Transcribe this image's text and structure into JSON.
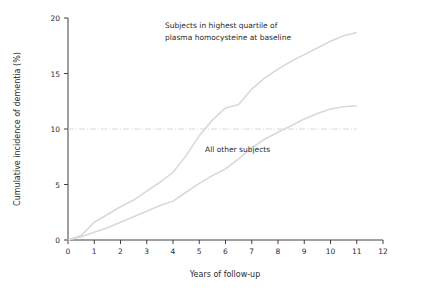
{
  "chart_data": {
    "type": "line",
    "title": "",
    "xlabel": "Years of follow-up",
    "ylabel": "Cumulative incidence of dementia (%)",
    "xlim": [
      0,
      12
    ],
    "ylim": [
      0,
      20
    ],
    "xticks": [
      "0",
      "1",
      "2",
      "3",
      "4",
      "5",
      "6",
      "7",
      "8",
      "9",
      "10",
      "11",
      "12"
    ],
    "yticks": [
      "0",
      "5",
      "10",
      "15",
      "20"
    ],
    "grid": false,
    "legend_position": "inline-annotations",
    "reference_line": {
      "y": 10,
      "style": "dash-dot",
      "color": "#d8d8d8"
    },
    "series": [
      {
        "name": "Subjects in highest quartile of plasma homocysteine at baseline",
        "color": "#d9d9d9",
        "x": [
          0,
          0.5,
          1,
          1.5,
          2,
          2.5,
          3,
          3.5,
          4,
          4.5,
          5,
          5.5,
          6,
          6.5,
          7,
          7.5,
          8,
          8.5,
          9,
          9.5,
          10,
          10.5,
          11
        ],
        "y": [
          0,
          0.4,
          1.6,
          2.3,
          3.0,
          3.6,
          4.4,
          5.2,
          6.1,
          7.6,
          9.4,
          10.8,
          11.9,
          12.2,
          13.6,
          14.6,
          15.4,
          16.1,
          16.7,
          17.3,
          17.9,
          18.4,
          18.7
        ]
      },
      {
        "name": "All other subjects",
        "color": "#d9d9d9",
        "x": [
          0,
          0.5,
          1,
          1.5,
          2,
          2.5,
          3,
          3.5,
          4,
          4.5,
          5,
          5.5,
          6,
          6.5,
          7,
          7.5,
          8,
          8.5,
          9,
          9.5,
          10,
          10.5,
          11
        ],
        "y": [
          0,
          0.3,
          0.7,
          1.1,
          1.6,
          2.1,
          2.6,
          3.1,
          3.5,
          4.3,
          5.1,
          5.8,
          6.4,
          7.3,
          8.3,
          9.1,
          9.7,
          10.3,
          10.9,
          11.4,
          11.8,
          12.0,
          12.1
        ]
      }
    ],
    "annotations": [
      {
        "name": "highest-quartile-label",
        "lines": [
          "Subjects in highest quartile of",
          "plasma homocysteine at baseline"
        ],
        "x": 165,
        "y": 28
      },
      {
        "name": "all-other-subjects-label",
        "lines": [
          "All other subjects"
        ],
        "x": 205,
        "y": 152
      }
    ]
  }
}
